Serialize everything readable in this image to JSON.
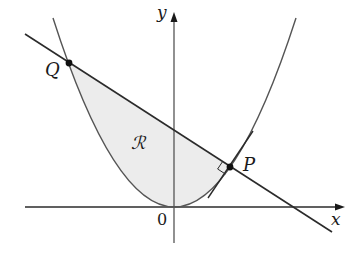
{
  "figure": {
    "labels": {
      "x_axis": "x",
      "y_axis": "y",
      "origin": "0",
      "point_p": "P",
      "point_q": "Q",
      "region": "ℛ"
    },
    "colors": {
      "stroke": "#2b2b2b",
      "curve": "#555555",
      "shade": "#ececec",
      "background": "#ffffff"
    }
  }
}
